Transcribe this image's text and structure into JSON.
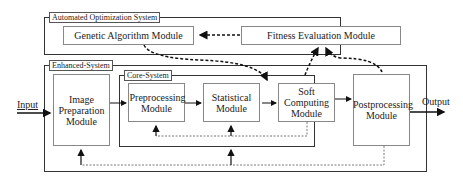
{
  "diagram": {
    "systems": {
      "automated": {
        "label": "Automated  Optimization System"
      },
      "enhanced": {
        "label": "Enhanced-System"
      },
      "core": {
        "label": "Core-System"
      }
    },
    "modules": {
      "genetic": {
        "label": "Genetic Algorithm Module"
      },
      "fitness": {
        "label": "Fitness Evaluation Module"
      },
      "image_prep": {
        "label": "Image Preparation Module"
      },
      "preprocessing": {
        "label": "Preprocessing Module"
      },
      "statistical": {
        "label": "Statistical Module"
      },
      "soft_computing": {
        "label": "Soft Computing Module"
      },
      "postprocessing": {
        "label": "Postprocessing Module"
      }
    },
    "io": {
      "input": "Input",
      "output": "Output"
    },
    "edges": [
      {
        "from": "input",
        "to": "image_prep",
        "style": "solid"
      },
      {
        "from": "image_prep",
        "to": "preprocessing",
        "style": "solid"
      },
      {
        "from": "preprocessing",
        "to": "statistical",
        "style": "solid"
      },
      {
        "from": "statistical",
        "to": "soft_computing",
        "style": "solid-bidirectional"
      },
      {
        "from": "soft_computing",
        "to": "postprocessing",
        "style": "solid"
      },
      {
        "from": "postprocessing",
        "to": "output",
        "style": "solid"
      },
      {
        "from": "fitness",
        "to": "genetic",
        "style": "dashed"
      },
      {
        "from": "genetic",
        "to": "statistical/soft_computing",
        "style": "dashed-bold"
      },
      {
        "from": "soft_computing",
        "to": "fitness",
        "style": "dashed-bold"
      },
      {
        "from": "postprocessing",
        "to": "fitness",
        "style": "dashed-bold"
      },
      {
        "from": "soft_computing",
        "to": "preprocessing/statistical",
        "style": "dotted-feedback"
      },
      {
        "from": "postprocessing",
        "to": "image_prep/statistical",
        "style": "dotted-feedback"
      }
    ]
  }
}
